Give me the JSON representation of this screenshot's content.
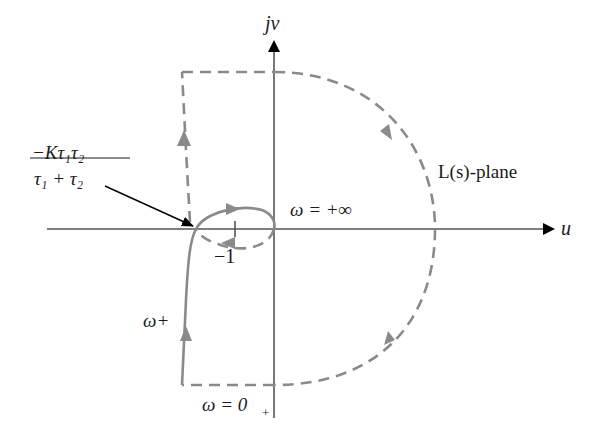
{
  "diagram": {
    "type": "nyquist-plot",
    "plane_label": "L(s)-plane",
    "axes": {
      "horizontal_label": "u",
      "vertical_label": "jv"
    },
    "labels": {
      "minus_one": "−1",
      "omega_inf": "ω = +∞",
      "omega_zero": "ω = 0",
      "omega_zero_sub": "+",
      "omega_plus": "ω+",
      "intercept_numerator": "−Kτ₁τ₂",
      "intercept_denominator": "τ₁ + τ₂"
    },
    "colors": {
      "axis": "#555555",
      "contour": "#8a8a8a",
      "text": "#1a1a1a",
      "pointer_arrow": "#000000"
    }
  }
}
